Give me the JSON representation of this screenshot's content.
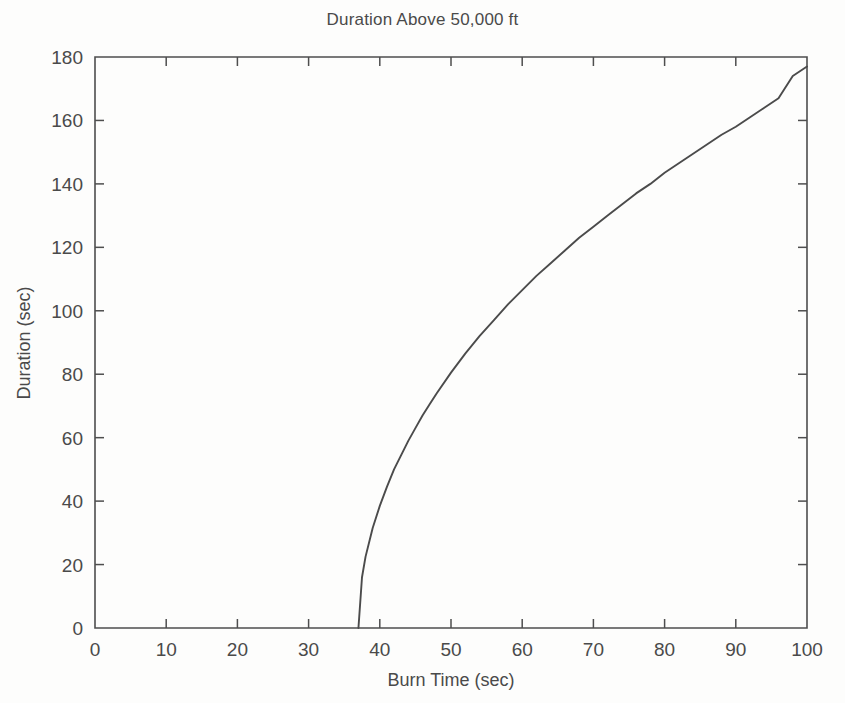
{
  "chart_data": {
    "type": "line",
    "title": "Duration Above 50,000 ft",
    "xlabel": "Burn Time (sec)",
    "ylabel": "Duration (sec)",
    "xlim": [
      0,
      100
    ],
    "ylim": [
      0,
      180
    ],
    "xticks": [
      0,
      10,
      20,
      30,
      40,
      50,
      60,
      70,
      80,
      90,
      100
    ],
    "yticks": [
      0,
      20,
      40,
      60,
      80,
      100,
      120,
      140,
      160,
      180
    ],
    "xtick_labels": [
      "0",
      "10",
      "20",
      "30",
      "40",
      "50",
      "60",
      "70",
      "80",
      "90",
      "100"
    ],
    "ytick_labels": [
      "0",
      "20",
      "40",
      "60",
      "80",
      "100",
      "120",
      "140",
      "160",
      "180"
    ],
    "grid": false,
    "legend": "none",
    "line_color": "#4b4b4b",
    "series": [
      {
        "name": "Duration Above 50,000 ft",
        "x": [
          37.0,
          37.5,
          38.0,
          39.0,
          40.0,
          41.0,
          42.0,
          43.0,
          44.0,
          45.0,
          46.0,
          47.0,
          48.0,
          50.0,
          52.0,
          54.0,
          56.0,
          58.0,
          60.0,
          62.0,
          64.0,
          66.0,
          68.0,
          70.0,
          72.0,
          74.0,
          76.0,
          78.0,
          80.0,
          82.0,
          84.0,
          86.0,
          88.0,
          90.0,
          92.0,
          94.0,
          96.0,
          98.0,
          100.0
        ],
        "y": [
          0.0,
          16.0,
          22.5,
          31.5,
          38.5,
          44.5,
          50.0,
          54.5,
          59.0,
          63.0,
          67.0,
          70.5,
          74.0,
          80.5,
          86.5,
          92.0,
          97.0,
          102.0,
          106.5,
          111.0,
          115.0,
          119.0,
          123.0,
          126.5,
          130.0,
          133.5,
          137.0,
          140.0,
          143.5,
          146.5,
          149.5,
          152.5,
          155.5,
          158.0,
          161.0,
          164.0,
          167.0,
          174.0,
          177.0
        ]
      }
    ],
    "annotations": []
  },
  "figure": {
    "background_color": "#fdfdfc",
    "text_color": "#4a4a4a"
  }
}
